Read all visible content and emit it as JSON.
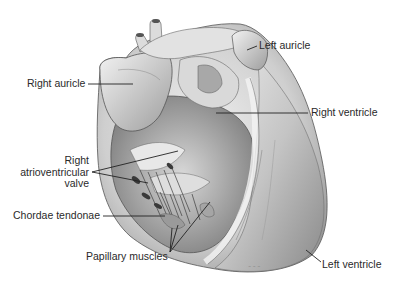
{
  "figure": {
    "colors": {
      "background": "#ffffff",
      "tissue_light": "#e6e6e6",
      "tissue_mid": "#bdbdbd",
      "tissue_dark": "#6a6a6a",
      "label_text": "#2a2a2a",
      "leader_line": "#222222"
    }
  },
  "labels": {
    "right_auricle": "Right auricle",
    "left_auricle": "Left auricle",
    "right_ventricle": "Right ventricle",
    "right_av_valve_line1": "Right",
    "right_av_valve_line2": "atrioventricular",
    "right_av_valve_line3": "valve",
    "chordae_tendonae": "Chordae tendonae",
    "papillary_muscles": "Papillary muscles",
    "left_ventricle": "Left ventricle"
  }
}
